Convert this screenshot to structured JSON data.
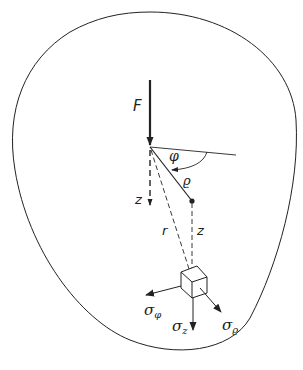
{
  "diagram": {
    "labels": {
      "force": "F",
      "angle": "φ",
      "radial": "ϱ",
      "z_axis": "z",
      "r": "r",
      "z_depth": "z",
      "sigma_phi": "σ",
      "sigma_phi_sub": "φ",
      "sigma_z": "σ",
      "sigma_z_sub": "z",
      "sigma_rho": "σ",
      "sigma_rho_sub": "ϱ"
    },
    "colors": {
      "stroke": "#222222",
      "background": "#ffffff"
    }
  }
}
